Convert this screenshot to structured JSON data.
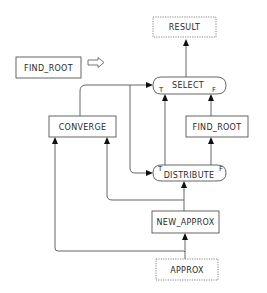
{
  "diagram": {
    "type": "dataflow",
    "title_node": {
      "label": "FIND_ROOT",
      "arrow": "hollow-right-arrow"
    },
    "nodes": {
      "result": {
        "label": "RESULT",
        "style": "dotted"
      },
      "select": {
        "label": "SELECT",
        "true_port": "T",
        "false_port": "F",
        "style": "rounded"
      },
      "converge": {
        "label": "CONVERGE",
        "style": "solid"
      },
      "find_root": {
        "label": "FIND_ROOT",
        "style": "solid"
      },
      "distribute": {
        "label": "DISTRIBUTE",
        "true_port": "T",
        "false_port": "F",
        "style": "rounded"
      },
      "new_approx": {
        "label": "NEW_APPROX",
        "style": "solid"
      },
      "approx": {
        "label": "APPROX",
        "style": "dotted"
      }
    },
    "edges": [
      {
        "from": "SELECT",
        "to": "RESULT"
      },
      {
        "from": "CONVERGE",
        "to": "SELECT"
      },
      {
        "from": "CONVERGE",
        "to": "DISTRIBUTE"
      },
      {
        "from": "DISTRIBUTE.T",
        "to": "SELECT.T"
      },
      {
        "from": "FIND_ROOT",
        "to": "SELECT.F"
      },
      {
        "from": "DISTRIBUTE.F",
        "to": "FIND_ROOT"
      },
      {
        "from": "NEW_APPROX",
        "to": "DISTRIBUTE"
      },
      {
        "from": "NEW_APPROX",
        "to": "CONVERGE"
      },
      {
        "from": "APPROX",
        "to": "NEW_APPROX"
      },
      {
        "from": "APPROX",
        "to": "CONVERGE"
      }
    ]
  }
}
